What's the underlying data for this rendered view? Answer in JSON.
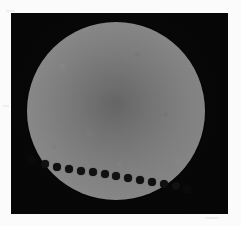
{
  "image": {
    "subject": "Venus transit across the solar disk",
    "type": "composite-astrophotograph",
    "caption": "",
    "frame": {
      "background_color": "#060606",
      "x": 11,
      "y": 13,
      "width": 217,
      "height": 201
    },
    "page_background_color": "#fbfbfb"
  },
  "solar_disk": {
    "name": "Sun",
    "center_x": 116,
    "center_y": 111,
    "radius": 89,
    "center_color": "#bcbcbc",
    "limb_color": "#8d8d8d",
    "limb_darkening": true
  },
  "transit": {
    "body": "Venus",
    "direction": "left-to-right along lower limb",
    "dot_color": "#121212",
    "dot_count": 12,
    "dots": [
      {
        "index": 1,
        "x": 45,
        "y": 164,
        "r": 4.0
      },
      {
        "index": 2,
        "x": 57,
        "y": 167,
        "r": 4.0
      },
      {
        "index": 3,
        "x": 69,
        "y": 169,
        "r": 4.2
      },
      {
        "index": 4,
        "x": 81,
        "y": 171,
        "r": 4.2
      },
      {
        "index": 5,
        "x": 93,
        "y": 172,
        "r": 4.2
      },
      {
        "index": 6,
        "x": 105,
        "y": 174,
        "r": 4.2
      },
      {
        "index": 7,
        "x": 116,
        "y": 176,
        "r": 4.2
      },
      {
        "index": 8,
        "x": 128,
        "y": 178,
        "r": 4.2
      },
      {
        "index": 9,
        "x": 140,
        "y": 180,
        "r": 4.2
      },
      {
        "index": 10,
        "x": 152,
        "y": 182,
        "r": 4.2
      },
      {
        "index": 11,
        "x": 164,
        "y": 184,
        "r": 4.2
      },
      {
        "index": 12,
        "x": 176,
        "y": 186,
        "r": 4.2
      }
    ],
    "notches": [
      {
        "label": "ingress-notch",
        "x": 31,
        "y": 159,
        "r": 4.5
      },
      {
        "label": "egress-notch",
        "x": 187,
        "y": 189,
        "r": 5.0
      }
    ]
  }
}
